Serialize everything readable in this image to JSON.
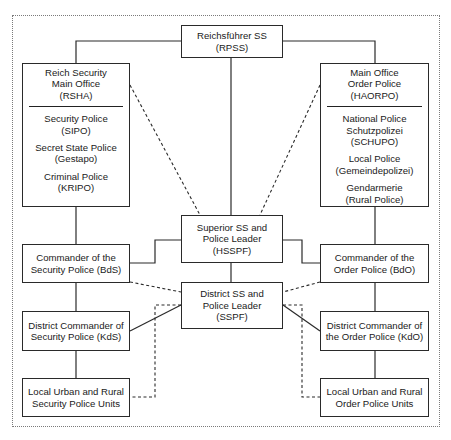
{
  "diagram": {
    "type": "organizational-chart",
    "frame_style": "dotted",
    "top": {
      "id": "rpss",
      "lines": [
        "Reichsführer SS",
        "(RPSS)"
      ]
    },
    "left_main": {
      "id": "rsha",
      "header": [
        "Reich Security",
        "Main Office",
        "(RSHA)"
      ],
      "groups": [
        [
          "Security Police",
          "(SIPO)"
        ],
        [
          "Secret State Police",
          "(Gestapo)"
        ],
        [
          "Criminal Police",
          "(KRIPO)"
        ]
      ]
    },
    "right_main": {
      "id": "haorpo",
      "header": [
        "Main Office",
        "Order Police",
        "(HAORPO)"
      ],
      "groups": [
        [
          "National Police",
          "Schutzpolizei",
          "(SCHUPO)"
        ],
        [
          "Local Police",
          "(Gemeindepolizei)"
        ],
        [
          "Gendarmerie",
          "(Rural Police)"
        ]
      ]
    },
    "center": {
      "hsspf": [
        "Superior SS and",
        "Police Leader",
        "(HSSPF)"
      ],
      "sspf": [
        "District SS and",
        "Police Leader",
        "(SSPF)"
      ]
    },
    "left_chain": {
      "bds": [
        "Commander of the",
        "Security Police (BdS)"
      ],
      "kds": [
        "District Commander of",
        "Security Police (KdS)"
      ],
      "local": [
        "Local Urban and Rural",
        "Security Police Units"
      ]
    },
    "right_chain": {
      "bdo": [
        "Commander of the",
        "Order Police (BdO)"
      ],
      "kdo": [
        "District Commander of",
        "the Order Police (KdO)"
      ],
      "local": [
        "Local Urban and Rural",
        "Order Police Units"
      ]
    },
    "connections": [
      {
        "from": "RPSS",
        "to": "RSHA",
        "style": "solid"
      },
      {
        "from": "RPSS",
        "to": "HAORPO",
        "style": "solid"
      },
      {
        "from": "RPSS",
        "to": "HSSPF",
        "style": "solid"
      },
      {
        "from": "RSHA",
        "to": "BdS",
        "style": "solid"
      },
      {
        "from": "HAORPO",
        "to": "BdO",
        "style": "solid"
      },
      {
        "from": "HSSPF",
        "to": "BdS",
        "style": "solid"
      },
      {
        "from": "HSSPF",
        "to": "BdO",
        "style": "solid"
      },
      {
        "from": "HSSPF",
        "to": "SSPF",
        "style": "solid"
      },
      {
        "from": "RSHA",
        "to": "HSSPF",
        "style": "dashed"
      },
      {
        "from": "HAORPO",
        "to": "HSSPF",
        "style": "dashed"
      },
      {
        "from": "BdS",
        "to": "SSPF",
        "style": "dashed"
      },
      {
        "from": "BdO",
        "to": "SSPF",
        "style": "dashed"
      },
      {
        "from": "BdS",
        "to": "KdS",
        "style": "solid"
      },
      {
        "from": "BdO",
        "to": "KdO",
        "style": "solid"
      },
      {
        "from": "SSPF",
        "to": "KdS",
        "style": "solid"
      },
      {
        "from": "SSPF",
        "to": "KdO",
        "style": "solid"
      },
      {
        "from": "KdS",
        "to": "Local Security Police Units",
        "style": "solid"
      },
      {
        "from": "KdO",
        "to": "Local Order Police Units",
        "style": "solid"
      },
      {
        "from": "SSPF",
        "to": "Local Security Police Units",
        "style": "dashed"
      },
      {
        "from": "SSPF",
        "to": "Local Order Police Units",
        "style": "dashed"
      }
    ]
  }
}
